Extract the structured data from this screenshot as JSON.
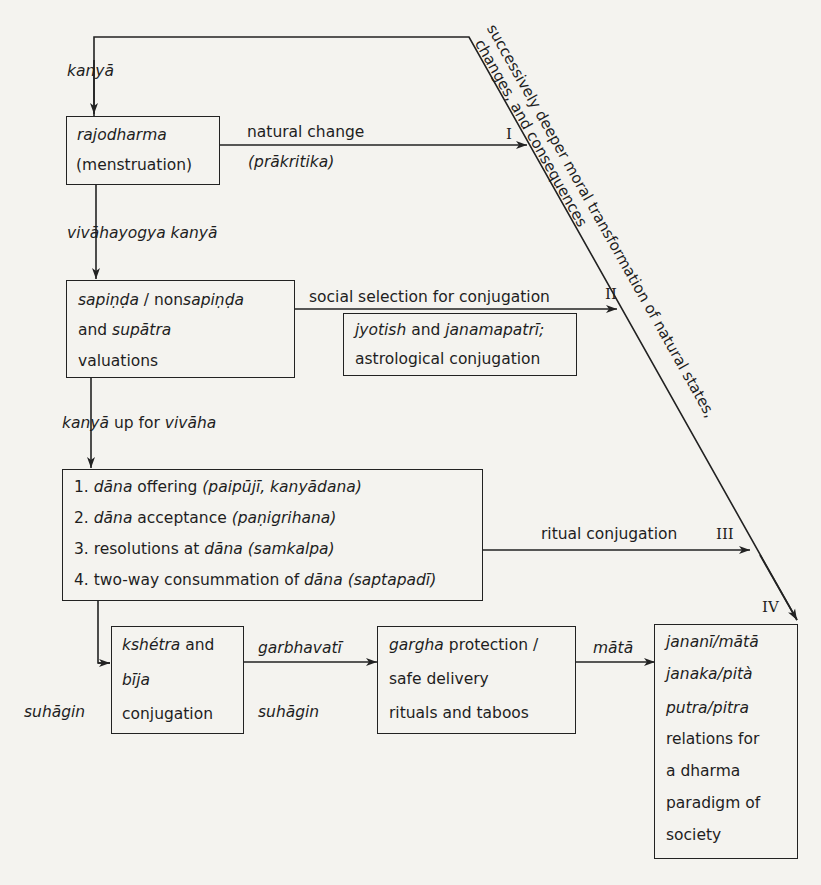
{
  "diagram": {
    "type": "flow",
    "top_feedback_line_label": "kanyā",
    "diagonal_label": {
      "line1": "successively deeper moral transformation of natural states,",
      "line2": "changes, and consequences"
    },
    "stage_markers": [
      "I",
      "II",
      "III",
      "IV"
    ],
    "nodes": {
      "rajodharma": {
        "line1": "rajodharma",
        "line2": "(menstruation)"
      },
      "sapinda": {
        "line1_a": "sapiṇḍa",
        "line1_b": " / non",
        "line1_c": "sapiṇḍa",
        "line2_a": "and ",
        "line2_b": "supātra",
        "line3": "valuations"
      },
      "jyotish": {
        "line1_a": "jyotish",
        "line1_b": " and ",
        "line1_c": "janamapatrī;",
        "line2": "astrological conjugation"
      },
      "dana": {
        "items": [
          {
            "num": "1. ",
            "a": "dāna",
            "b": " offering ",
            "c": "(paipūjī, kanyādana)"
          },
          {
            "num": "2. ",
            "a": "dāna",
            "b": " acceptance ",
            "c": "(paṇigrihana)"
          },
          {
            "num": "3. ",
            "b0": "resolutions at ",
            "a": "dāna",
            "c": " (samkalpa)"
          },
          {
            "num": "4. ",
            "b0": "two-way consummation of ",
            "a": "dāna",
            "c": " (saptapadī)"
          }
        ]
      },
      "kshetra": {
        "line1_a": "kshétra",
        "line1_b": " and",
        "line2": "bīja",
        "line3": "conjugation"
      },
      "gargha": {
        "line1_a": "gargha",
        "line1_b": " protection /",
        "line2": "safe delivery",
        "line3": "rituals and taboos"
      },
      "janani": {
        "line1": "jananī/mātā",
        "line2": "janaka/pità",
        "line3": "putra/pitra",
        "line4": "relations for",
        "line5": "a dharma",
        "line6": "paradigm of",
        "line7": "society"
      }
    },
    "edges": {
      "kanya": "kanyā",
      "vivahayogya": "vivāhayogya kanyā",
      "kanya_up_a": "kanyā",
      "kanya_up_b": " up for ",
      "kanya_up_c": "vivāha",
      "natural_change": "natural change",
      "prakritika": "(prākritika)",
      "social_selection": "social selection for conjugation",
      "ritual_conjugation": "ritual conjugation",
      "garbhavati": "garbhavatī",
      "suhagin_left": "suhāgin",
      "suhagin_mid": "suhāgin",
      "mata": "mātā"
    }
  }
}
